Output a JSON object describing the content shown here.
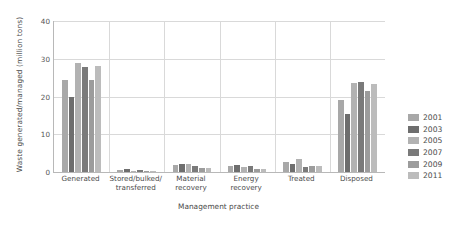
{
  "chart_data": {
    "type": "bar",
    "title": "",
    "xlabel": "Management practice",
    "ylabel": "Waste generated/managed (million tons)",
    "ylim": [
      0,
      40
    ],
    "yticks": [
      "0",
      "10",
      "20",
      "30",
      "40"
    ],
    "grid": true,
    "legend_position": "right",
    "categories": [
      "Generated",
      "Stored/bulked/ transferred",
      "Material recovery",
      "Energy recovery",
      "Treated",
      "Disposed"
    ],
    "category_lines": [
      [
        "Generated",
        ""
      ],
      [
        "Stored/bulked/",
        "transferred"
      ],
      [
        "Material",
        "recovery"
      ],
      [
        "Energy",
        "recovery"
      ],
      [
        "Treated",
        ""
      ],
      [
        "Disposed",
        ""
      ]
    ],
    "series": [
      {
        "name": "2001",
        "color": "#a8a8a8",
        "values": [
          24.5,
          0.5,
          1.8,
          1.6,
          2.6,
          19.0
        ]
      },
      {
        "name": "2003",
        "color": "#6e6e6e",
        "values": [
          20.0,
          0.9,
          2.2,
          1.9,
          2.0,
          15.5
        ]
      },
      {
        "name": "2005",
        "color": "#b2b2b2",
        "values": [
          28.8,
          0.4,
          2.0,
          1.4,
          3.4,
          23.5
        ]
      },
      {
        "name": "2007",
        "color": "#7a7a7a",
        "values": [
          27.7,
          0.5,
          1.7,
          1.7,
          1.2,
          23.8
        ]
      },
      {
        "name": "2009",
        "color": "#9c9c9c",
        "values": [
          24.5,
          0.4,
          1.1,
          0.9,
          1.5,
          21.5
        ]
      },
      {
        "name": "2011",
        "color": "#bcbcbc",
        "values": [
          28.2,
          0.4,
          1.0,
          0.8,
          1.6,
          23.2
        ]
      }
    ]
  }
}
